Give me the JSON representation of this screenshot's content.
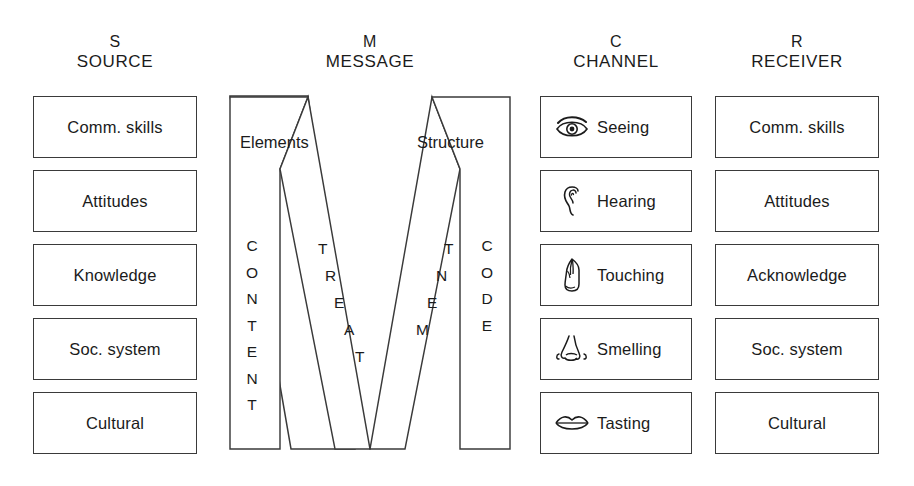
{
  "diagram": {
    "ink_color": "#3a3a3a",
    "text_color": "#1b1b1b",
    "background": "#ffffff"
  },
  "columns": [
    {
      "key": "source",
      "letter": "S",
      "word": "SOURCE",
      "items": [
        {
          "label": "Comm. skills"
        },
        {
          "label": "Attitudes"
        },
        {
          "label": "Knowledge"
        },
        {
          "label": "Soc. system"
        },
        {
          "label": "Cultural"
        }
      ]
    },
    {
      "key": "message",
      "letter": "M",
      "word": "MESSAGE",
      "side_labels": {
        "left": "Elements",
        "right": "Structure"
      },
      "vertical_words": {
        "left": "CONTENT",
        "right": "CODE"
      },
      "diagonal_words": {
        "left": "TREAT",
        "right": "TNEM"
      },
      "combined_diagonal_word": "TREATMENT"
    },
    {
      "key": "channel",
      "letter": "C",
      "word": "CHANNEL",
      "items": [
        {
          "label": "Seeing",
          "icon": "eye-icon"
        },
        {
          "label": "Hearing",
          "icon": "ear-icon"
        },
        {
          "label": "Touching",
          "icon": "hand-icon"
        },
        {
          "label": "Smelling",
          "icon": "nose-icon"
        },
        {
          "label": "Tasting",
          "icon": "lips-icon"
        }
      ]
    },
    {
      "key": "receiver",
      "letter": "R",
      "word": "RECEIVER",
      "items": [
        {
          "label": "Comm. skills"
        },
        {
          "label": "Attitudes"
        },
        {
          "label": "Acknowledge"
        },
        {
          "label": "Soc. system"
        },
        {
          "label": "Cultural"
        }
      ]
    }
  ]
}
